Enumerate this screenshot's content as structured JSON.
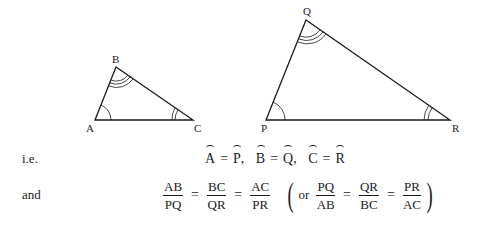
{
  "figure": {
    "triangle_small": {
      "vertices": {
        "A": [
          95,
          120
        ],
        "B": [
          116,
          67
        ],
        "C": [
          193,
          120
        ]
      },
      "labels": {
        "A": "A",
        "B": "B",
        "C": "C"
      }
    },
    "triangle_large": {
      "vertices": {
        "P": [
          266,
          120
        ],
        "Q": [
          306,
          20
        ],
        "R": [
          450,
          120
        ]
      },
      "labels": {
        "P": "P",
        "Q": "Q",
        "R": "R"
      }
    }
  },
  "statement1": {
    "prefix": "i.e.",
    "pairs": [
      {
        "left": "A",
        "eq": "=",
        "right": "P",
        "sep": ","
      },
      {
        "left": "B",
        "eq": "=",
        "right": "Q",
        "sep": ","
      },
      {
        "left": "C",
        "eq": "=",
        "right": "R",
        "sep": ""
      }
    ]
  },
  "statement2": {
    "prefix": "and",
    "fractions": [
      {
        "num": "AB",
        "den": "PQ"
      },
      {
        "num": "BC",
        "den": "QR"
      },
      {
        "num": "AC",
        "den": "PR"
      }
    ],
    "eq": "=",
    "alt_open": "(",
    "alt_word": "or",
    "alt_fractions": [
      {
        "num": "PQ",
        "den": "AB"
      },
      {
        "num": "QR",
        "den": "BC"
      },
      {
        "num": "PR",
        "den": "AC"
      }
    ],
    "alt_close": ")"
  }
}
